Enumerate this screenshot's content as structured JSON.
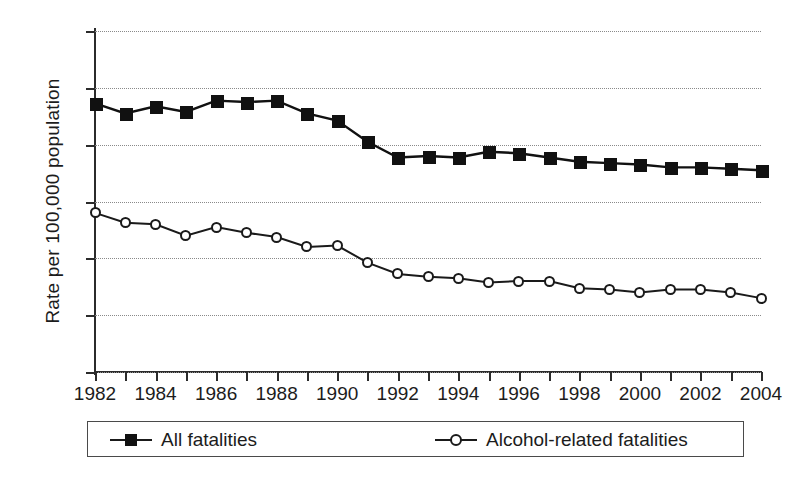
{
  "chart_data": {
    "type": "line",
    "title": "",
    "xlabel": "",
    "ylabel": "Rate per 100,000 population",
    "ylim": [
      0,
      24
    ],
    "yticks": [
      0,
      4,
      8,
      12,
      16,
      20,
      24
    ],
    "ytick_labels": [
      "0",
      "4",
      "8",
      "12",
      "16",
      "20",
      "24"
    ],
    "grid": true,
    "grid_axis": "y",
    "legend_position": "below",
    "x": [
      1982,
      1983,
      1984,
      1985,
      1986,
      1987,
      1988,
      1989,
      1990,
      1991,
      1992,
      1993,
      1994,
      1995,
      1996,
      1997,
      1998,
      1999,
      2000,
      2001,
      2002,
      2003,
      2004
    ],
    "xtick_labels": [
      "1982",
      "",
      "1984",
      "",
      "1986",
      "",
      "1988",
      "",
      "1990",
      "",
      "1992",
      "",
      "1994",
      "",
      "1996",
      "",
      "1998",
      "",
      "2000",
      "",
      "2002",
      "",
      "2004"
    ],
    "series": [
      {
        "name": "All fatalities",
        "marker": "filled-square",
        "color": "#111111",
        "values": [
          18.9,
          18.2,
          18.7,
          18.3,
          19.1,
          19.0,
          19.1,
          18.2,
          17.7,
          16.2,
          15.1,
          15.2,
          15.1,
          15.5,
          15.4,
          15.1,
          14.8,
          14.7,
          14.6,
          14.4,
          14.4,
          14.3,
          14.2
        ]
      },
      {
        "name": "Alcohol-related fatalities",
        "marker": "open-circle",
        "color": "#1a1a1a",
        "values": [
          11.2,
          10.5,
          10.4,
          9.6,
          10.2,
          9.8,
          9.5,
          8.8,
          8.9,
          7.7,
          6.9,
          6.7,
          6.6,
          6.3,
          6.4,
          6.4,
          5.9,
          5.8,
          5.6,
          5.8,
          5.8,
          5.6,
          5.2
        ]
      }
    ]
  },
  "legend": {
    "entries": [
      {
        "label": "All fatalities"
      },
      {
        "label": "Alcohol-related fatalities"
      }
    ]
  }
}
